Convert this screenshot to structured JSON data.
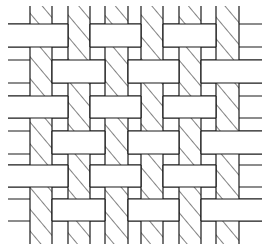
{
  "diagram": {
    "title": "",
    "type": "basket-weave pattern",
    "colors": {
      "background": "#ffffff",
      "stroke": "#1a1a1a",
      "weft_fill": "#ffffff",
      "warp_fill": "hatched"
    },
    "line_extent_x": [
      8,
      262
    ],
    "warp_extent_y": [
      6,
      244
    ],
    "warp_strips": [
      {
        "id": "V0",
        "x": 30,
        "w": 22
      },
      {
        "id": "V1",
        "x": 68,
        "w": 22
      },
      {
        "id": "V2",
        "x": 105,
        "w": 23
      },
      {
        "id": "V3",
        "x": 141,
        "w": 22
      },
      {
        "id": "V4",
        "x": 179,
        "w": 22
      },
      {
        "id": "V5",
        "x": 216,
        "w": 23
      }
    ],
    "weft_strips": [
      {
        "id": "H0",
        "y": 24,
        "h": 23,
        "over": [
          0,
          2,
          4
        ]
      },
      {
        "id": "H1",
        "y": 60,
        "h": 23,
        "over": [
          1,
          3,
          5
        ]
      },
      {
        "id": "H2",
        "y": 96,
        "h": 22,
        "over": [
          0,
          2,
          4
        ]
      },
      {
        "id": "H3",
        "y": 131,
        "h": 23,
        "over": [
          1,
          3,
          5
        ]
      },
      {
        "id": "H4",
        "y": 165,
        "h": 22,
        "over": [
          0,
          2,
          4
        ]
      },
      {
        "id": "H5",
        "y": 199,
        "h": 22,
        "over": [
          1,
          3,
          5
        ]
      }
    ]
  }
}
